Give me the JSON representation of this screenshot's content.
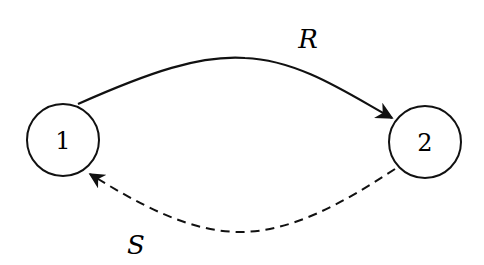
{
  "nodes": [
    {
      "id": "1",
      "label": "1"
    },
    {
      "id": "2",
      "label": "2"
    }
  ],
  "edges": [
    {
      "from": "1",
      "to": "2",
      "label": "R",
      "style": "solid"
    },
    {
      "from": "2",
      "to": "1",
      "label": "S",
      "style": "dashed"
    }
  ],
  "colors": {
    "stroke": "#111111",
    "background": "#ffffff"
  }
}
